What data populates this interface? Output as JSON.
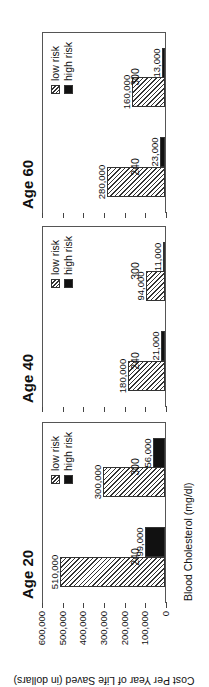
{
  "chart_data": {
    "type": "bar",
    "orientation": "figure rotated 90deg counterclockwise",
    "ylabel": "Cost Per Year of Life Saved (in dollars)",
    "xlabel": "Blood Cholesterol (mg/dl)",
    "ylim": [
      0,
      600000
    ],
    "yticks": [
      "600,000",
      "500,000",
      "400,000",
      "300,000",
      "200,000",
      "100,000",
      "0"
    ],
    "legend": [
      "low risk",
      "high risk"
    ],
    "categories": [
      "240",
      "300"
    ],
    "panels": [
      {
        "title": "Age 20",
        "series": [
          {
            "name": "low risk",
            "values": [
              510000,
              300000
            ],
            "labels": [
              "510,000",
              "300,000"
            ]
          },
          {
            "name": "high risk",
            "values": [
              99000,
              56000
            ],
            "labels": [
              "99,000",
              "56,000"
            ]
          }
        ]
      },
      {
        "title": "Age 40",
        "series": [
          {
            "name": "low risk",
            "values": [
              180000,
              94000
            ],
            "labels": [
              "180,000",
              "94,000"
            ]
          },
          {
            "name": "high risk",
            "values": [
              21000,
              11000
            ],
            "labels": [
              "21,000",
              "11,000"
            ]
          }
        ]
      },
      {
        "title": "Age 60",
        "series": [
          {
            "name": "low risk",
            "values": [
              280000,
              160000
            ],
            "labels": [
              "280,000",
              "160,000"
            ]
          },
          {
            "name": "high risk",
            "values": [
              23000,
              13000
            ],
            "labels": [
              "23,000",
              "13,000"
            ]
          }
        ]
      }
    ],
    "grid": false,
    "legend_position": "top-right of each panel"
  },
  "colors": {
    "low_risk": "hatched",
    "high_risk": "#111111",
    "axis": "#444444"
  }
}
